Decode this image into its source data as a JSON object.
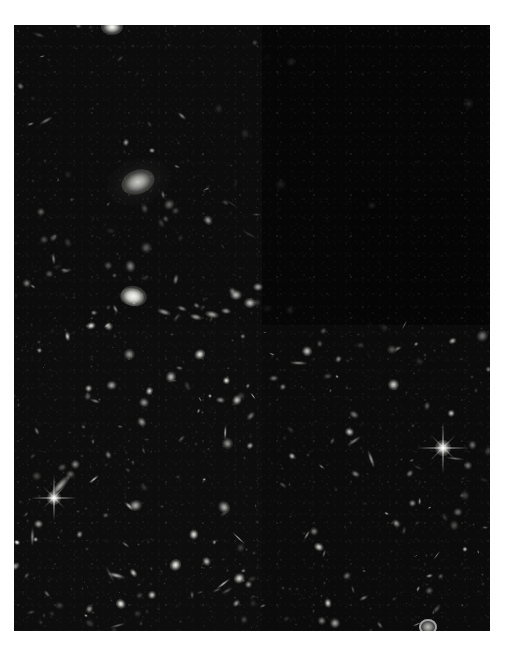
{
  "caption": {
    "text": "HUBBLE DEEP FIELD",
    "color": "#b9b9b9",
    "visible_fragment": true
  },
  "plate": {
    "name": "deep-field-exposure",
    "left": 14,
    "top": 25,
    "width": 476,
    "height": 606,
    "background_color": "#080808",
    "page_background": "#ffffff"
  },
  "mosaic": {
    "description": "Multi-chip mosaic; upper-right quadrant is notably darker than the rest",
    "vertical_seam_x": 248,
    "horizontal_seam_y": 300,
    "right_horizontal_seam_y": 300,
    "chips": [
      {
        "id": "chip-upper-left",
        "x": 0,
        "y": 0,
        "w": 248,
        "h": 300,
        "level": "#0c0c0c"
      },
      {
        "id": "chip-upper-right",
        "x": 248,
        "y": 0,
        "w": 228,
        "h": 300,
        "level": "#060606"
      },
      {
        "id": "chip-upper-right-inner",
        "x": 338,
        "y": 165,
        "w": 138,
        "h": 135,
        "level": "#050505"
      },
      {
        "id": "chip-lower-left",
        "x": 0,
        "y": 300,
        "w": 248,
        "h": 306,
        "level": "#0d0d0d"
      },
      {
        "id": "chip-lower-right",
        "x": 248,
        "y": 300,
        "w": 228,
        "h": 306,
        "level": "#0b0b0b"
      }
    ]
  },
  "objects": {
    "count_note": "stars and galaxies rendered as soft ellipses",
    "bright_features": [
      {
        "name": "large-elliptical-galaxy",
        "x": 124,
        "y": 157,
        "rx": 17,
        "ry": 12,
        "brightness": 1.0,
        "angle": -20
      },
      {
        "name": "bright-galaxy-left",
        "x": 120,
        "y": 271,
        "rx": 13,
        "ry": 10,
        "brightness": 0.95,
        "angle": 15
      },
      {
        "name": "bright-star-spiked",
        "x": 40,
        "y": 473,
        "rx": 7,
        "ry": 7,
        "brightness": 1.0,
        "angle": 0
      },
      {
        "name": "bright-star-right",
        "x": 429,
        "y": 423,
        "rx": 8,
        "ry": 8,
        "brightness": 1.0,
        "angle": 0
      },
      {
        "name": "top-bright-blob",
        "x": 98,
        "y": 2,
        "rx": 11,
        "ry": 8,
        "brightness": 1.0,
        "angle": 0
      },
      {
        "name": "ring-galaxy-bottom",
        "x": 414,
        "y": 602,
        "rx": 9,
        "ry": 8,
        "brightness": 0.85,
        "angle": 0
      },
      {
        "name": "edge-on-spiral",
        "x": 46,
        "y": 461,
        "rx": 14,
        "ry": 4,
        "brightness": 0.8,
        "angle": -48
      }
    ]
  }
}
